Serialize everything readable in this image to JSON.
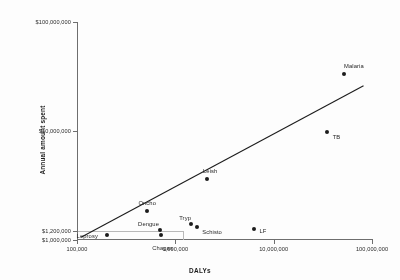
{
  "chart_data": {
    "type": "scatter",
    "title": "",
    "xlabel": "DALYs",
    "ylabel": "Annual amount spent",
    "xscale": "log",
    "yscale": "log",
    "xlim": [
      100000,
      100000000
    ],
    "ylim": [
      1000000,
      100000000
    ],
    "xticks": [
      100000,
      1000000,
      10000000,
      100000000
    ],
    "xticklabels": [
      "100,000",
      "1,000,000",
      "10,000,000",
      "100,000,000"
    ],
    "yticks": [
      1000000,
      1200000,
      10000000,
      100000000
    ],
    "yticklabels": [
      "$1,000,000",
      "$1,200,000",
      "$10,000,000",
      "$100,000,000"
    ],
    "grid": false,
    "legend": "none",
    "reference_lines": {
      "y": 1200000,
      "x": 1200000,
      "color": "#b9b9b9"
    },
    "trendline": {
      "present": true,
      "color": "#1c1c1c",
      "x": [
        110000,
        82000000
      ],
      "y": [
        1060000,
        26000000
      ]
    },
    "points": [
      {
        "label": "Leprosy",
        "x": 200000,
        "y": 1100000
      },
      {
        "label": "Oncho",
        "x": 520000,
        "y": 1850000
      },
      {
        "label": "Chagas",
        "x": 720000,
        "y": 1110000
      },
      {
        "label": "Dengue",
        "x": 700000,
        "y": 1240000
      },
      {
        "label": "Tryp",
        "x": 1450000,
        "y": 1400000
      },
      {
        "label": "Schisto",
        "x": 1650000,
        "y": 1330000
      },
      {
        "label": "Leish",
        "x": 2100000,
        "y": 3600000
      },
      {
        "label": "LF",
        "x": 6300000,
        "y": 1270000
      },
      {
        "label": "TB",
        "x": 35000000,
        "y": 9800000
      },
      {
        "label": "Malaria",
        "x": 52000000,
        "y": 33000000
      }
    ]
  }
}
